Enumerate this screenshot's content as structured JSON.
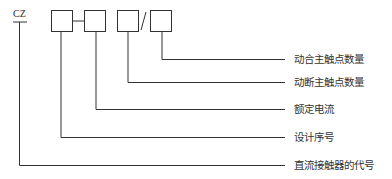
{
  "diagram": {
    "type": "model-code-breakdown",
    "prefix": "CZ",
    "separator_slash": "/",
    "boxes": [
      {
        "id": "box-1",
        "meaning": "设计序号"
      },
      {
        "id": "box-2",
        "meaning": "额定电流"
      },
      {
        "id": "box-3",
        "meaning": "动断主触点数量"
      },
      {
        "id": "box-4",
        "meaning": "动合主触点数量"
      }
    ],
    "labels": [
      {
        "text": "动合主触点数量",
        "points_to": "box-4"
      },
      {
        "text": "动断主触点数量",
        "points_to": "box-3"
      },
      {
        "text": "额定电流",
        "points_to": "box-2"
      },
      {
        "text": "设计序号",
        "points_to": "box-1"
      },
      {
        "text": "直流接触器的代号",
        "points_to": "prefix"
      }
    ],
    "line_color": "#333333"
  }
}
